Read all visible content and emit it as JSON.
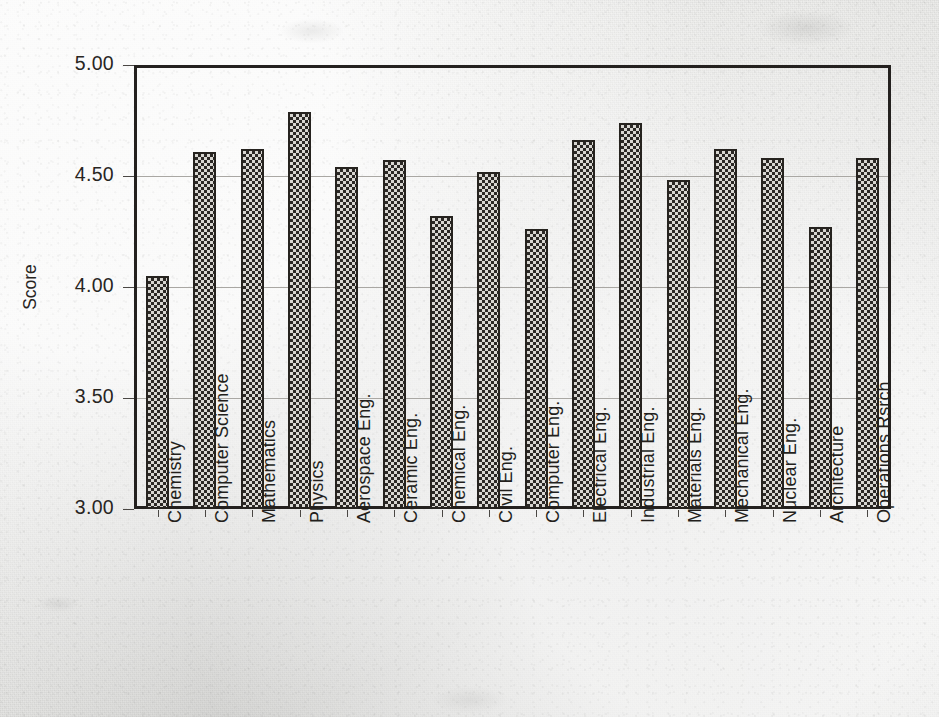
{
  "chart_data": {
    "type": "bar",
    "title": "",
    "xlabel": "",
    "ylabel": "Score",
    "ylim": [
      3.0,
      5.0
    ],
    "yticks": [
      "3.00",
      "3.50",
      "4.00",
      "4.50",
      "5.00"
    ],
    "ytick_values": [
      3.0,
      3.5,
      4.0,
      4.5,
      5.0
    ],
    "grid": true,
    "legend": "none",
    "categories": [
      "Chemistry",
      "Computer Science",
      "Mathematics",
      "Physics",
      "Aerospace Eng.",
      "Ceramic Eng.",
      "Chemical Eng.",
      "Civil Eng.",
      "Computer Eng.",
      "Electrical Eng.",
      "Industrial Eng.",
      "Materials  Eng.",
      "Mechanical Eng.",
      "Nuclear  Eng.",
      "Architecture",
      "Operations Rsrch"
    ],
    "values": [
      4.05,
      4.61,
      4.62,
      4.79,
      4.54,
      4.57,
      4.32,
      4.52,
      4.26,
      4.66,
      4.74,
      4.48,
      4.62,
      4.58,
      4.27,
      4.58
    ]
  },
  "style": {
    "bar_fill_color": "#7c7a75",
    "bar_edge_color": "#26231f",
    "frame_color": "#24211f",
    "grid_color": "#a9a7a3",
    "text_color": "#28251f",
    "background_color": "#e9e9e7"
  }
}
